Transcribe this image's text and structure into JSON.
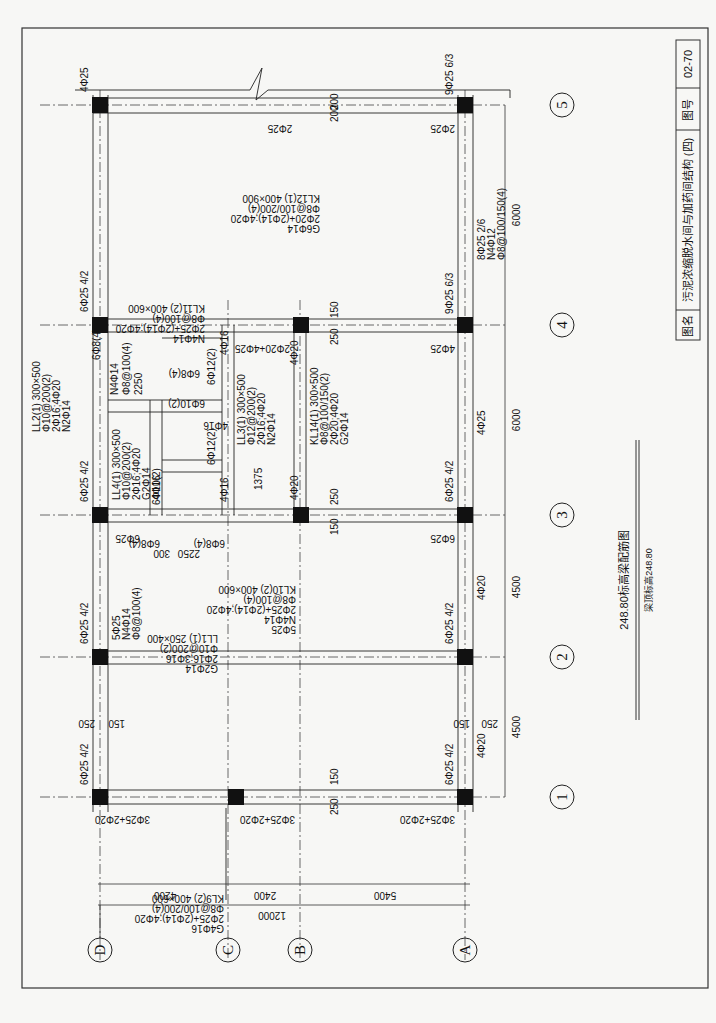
{
  "title_block": {
    "name_label": "图名",
    "name_value": "污泥浓缩脱水间与加药间结构 (四)",
    "number_label": "图号",
    "number_value": "02-70"
  },
  "drawing": {
    "caption": "248.80标高梁配筋图",
    "subcaption": "梁顶标高248.80",
    "orientation": "rotated 90° counterclockwise"
  },
  "axes": {
    "letters": [
      "D",
      "C",
      "B",
      "A"
    ],
    "numbers": [
      "1",
      "2",
      "3",
      "4",
      "5"
    ]
  },
  "dimensions": {
    "letter_spans": [
      "4200",
      "2400",
      "5400"
    ],
    "letter_total": "12000",
    "number_spans": [
      "4500",
      "4500",
      "6000",
      "6000"
    ]
  },
  "beams": {
    "KL9": [
      "KL9(2) 400×600",
      "Φ8@100/200(4)",
      "2Φ25+(2Φ14);4Φ20",
      "G4Φ16"
    ],
    "KL10": [
      "KL10(2) 400×600",
      "Φ8@100(4)",
      "2Φ25+(2Φ14);4Φ20",
      "N4Φ14",
      "5Φ25"
    ],
    "KL11": [
      "KL11(2) 400×600",
      "Φ8@100(4)",
      "2Φ25+(2Φ14);4Φ20",
      "N4Φ14"
    ],
    "KL12": [
      "KL12(1) 400×900",
      "Φ8@100/200(4)",
      "2Φ20+(2Φ14);4Φ20",
      "G6Φ14"
    ],
    "KL14": [
      "KL14(1) 300×500",
      "Φ8@100/150(2)",
      "2Φ20;4Φ20",
      "G2Φ14"
    ],
    "LL1": [
      "LL1(1) 250×400",
      "Φ10@200(2)",
      "2Φ16;3Φ16",
      "G2Φ14"
    ],
    "LL2": [
      "LL2(1) 300×500",
      "Φ10@200(2)",
      "2Φ16;4Φ20",
      "N2Φ14"
    ],
    "LL3": [
      "LL3(1) 300×500",
      "Φ12@200(2)",
      "2Φ16;4Φ20",
      "N2Φ14"
    ],
    "LL4": [
      "LL4(1) 300×500",
      "Φ10@200(2)",
      "2Φ16;4Φ20",
      "G2Φ14",
      "4Φ16"
    ],
    "A_axis": [
      "8Φ25 2/6",
      "N4Φ12",
      "Φ8@100/150(4)"
    ],
    "D_side_1": [
      "5Φ25",
      "N4Φ14",
      "Φ8@100(4)"
    ],
    "LL2_side": [
      "N4Φ14",
      "Φ8@100(4)",
      "2250"
    ]
  },
  "rebar_labels": {
    "top_row5": "4Φ25",
    "under_row5": "2Φ25",
    "row5_A": "9Φ25 6/3",
    "row5_A_under": "2Φ25",
    "row4_D": "6Φ25 4/2",
    "row4_A": "9Φ25 6/3",
    "row4_A_under": "4Φ25",
    "row4_B_under": "2Φ20+4Φ25",
    "row3_D": "6Φ25 4/2",
    "row3_A": "6Φ25 4/2",
    "row3_A_under": "6Φ25",
    "row3_D_under": "6Φ25",
    "row2_D": "6Φ25 4/2",
    "row2_A": "6Φ25 4/2",
    "row1_D": "6Φ25 4/2",
    "row1_A": "6Φ25 4/2",
    "row1_under_D": "3Φ25+2Φ20",
    "row1_under_B": "3Φ25+2Φ20",
    "row1_under_A": "3Φ25+2Φ20",
    "A_span12": "4Φ20",
    "A_span23": "4Φ20",
    "A_span34": "4Φ25",
    "B_near4": "4Φ20",
    "B_near3": "4Φ20",
    "stirrup_6_8_4": "6Φ8(4)",
    "stirrup_6_10_2": "6Φ10(2)",
    "stirrup_6_12_2": "6Φ12(2)",
    "bar_4_16": "4Φ16",
    "dim_300": "300",
    "dim_2250": "2250",
    "dim_1375": "1375",
    "dim_250": "250",
    "dim_150": "150",
    "dim_200": "200"
  }
}
